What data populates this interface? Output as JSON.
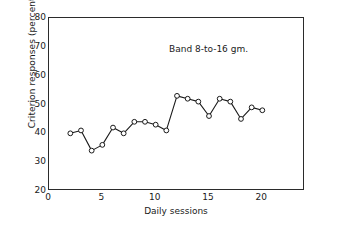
{
  "chart_data": {
    "type": "line",
    "title": "",
    "annotation": "Band 8-to-16 gm.",
    "xlabel": "Daily sessions",
    "ylabel": "Criterion responses (percent)",
    "xlim": [
      0,
      24
    ],
    "ylim": [
      20,
      80
    ],
    "xticks": [
      0,
      5,
      10,
      15,
      20
    ],
    "yticks": [
      20,
      30,
      40,
      50,
      60,
      70,
      80
    ],
    "xtick_labels": [
      "0",
      "5",
      "10",
      "15",
      "20"
    ],
    "ytick_labels": [
      "20",
      "30",
      "40",
      "50",
      "60",
      "70",
      "80"
    ],
    "grid": false,
    "legend": null,
    "marker": "open-circle",
    "line_color": "#1a1a1a",
    "marker_face_color": "#ffffff",
    "series": [
      {
        "name": "Band 8-to-16 gm.",
        "x": [
          2,
          3,
          4,
          5,
          6,
          7,
          8,
          9,
          10,
          11,
          12,
          13,
          14,
          15,
          16,
          17,
          18,
          19,
          20
        ],
        "values": [
          40,
          41,
          34,
          36,
          42,
          40,
          44,
          44,
          43,
          41,
          53,
          52,
          51,
          46,
          52,
          51,
          45,
          49,
          48
        ]
      }
    ]
  }
}
